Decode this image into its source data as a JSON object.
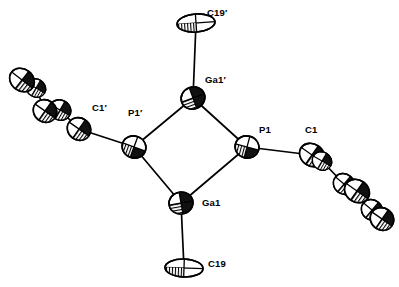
{
  "figure": {
    "type": "ortep-thermal-ellipsoid-plot",
    "background_color": "#ffffff",
    "line_color": "#000000",
    "fill_color": "#ffffff",
    "shade_color": "#1a1a1a"
  },
  "labels": [
    {
      "id": "C19p",
      "text": "C19′",
      "x": 207,
      "y": 8
    },
    {
      "id": "Ga1p",
      "text": "Ga1′",
      "x": 205,
      "y": 75
    },
    {
      "id": "P1p",
      "text": "P1′",
      "x": 128,
      "y": 108
    },
    {
      "id": "C1p",
      "text": "C1′",
      "x": 92,
      "y": 103
    },
    {
      "id": "P1",
      "text": "P1",
      "x": 259,
      "y": 125
    },
    {
      "id": "C1",
      "text": "C1",
      "x": 305,
      "y": 125
    },
    {
      "id": "Ga1",
      "text": "Ga1",
      "x": 202,
      "y": 198
    },
    {
      "id": "C19",
      "text": "C19",
      "x": 208,
      "y": 259
    }
  ],
  "ring_atoms": [
    {
      "id": "Ga1p",
      "label": "Ga1′",
      "x": 193,
      "y": 98,
      "rx": 12,
      "ry": 11,
      "rot": -20,
      "kind": "gallium"
    },
    {
      "id": "P1",
      "label": "P1",
      "x": 247,
      "y": 147,
      "rx": 12,
      "ry": 11,
      "rot": 15,
      "kind": "phosphorus"
    },
    {
      "id": "Ga1",
      "label": "Ga1",
      "x": 181,
      "y": 203,
      "rx": 12,
      "ry": 11,
      "rot": -10,
      "kind": "gallium"
    },
    {
      "id": "P1p",
      "label": "P1′",
      "x": 134,
      "y": 147,
      "rx": 12,
      "ry": 11,
      "rot": 20,
      "kind": "phosphorus"
    }
  ],
  "methyl_atoms": [
    {
      "id": "C19p",
      "label": "C19′",
      "x": 196,
      "y": 23,
      "rx": 19,
      "ry": 9,
      "rot": -4,
      "kind": "carbon-disc"
    },
    {
      "id": "C19",
      "label": "C19",
      "x": 184,
      "y": 268,
      "rx": 19,
      "ry": 9,
      "rot": 2,
      "kind": "carbon-disc"
    }
  ],
  "ring_bonds": [
    {
      "from": "Ga1p",
      "to": "P1"
    },
    {
      "from": "P1",
      "to": "Ga1"
    },
    {
      "from": "Ga1",
      "to": "P1p"
    },
    {
      "from": "P1p",
      "to": "Ga1p"
    }
  ],
  "terminal_bonds": [
    {
      "from": "Ga1p",
      "to": "C19p"
    },
    {
      "from": "Ga1",
      "to": "C19"
    },
    {
      "from": "P1",
      "to": "C1"
    },
    {
      "from": "P1p",
      "to": "C1p"
    }
  ],
  "right_substituent": {
    "name": "aryl-group-right",
    "atoms": [
      {
        "id": "C1",
        "x": 312,
        "y": 155,
        "rx": 13,
        "ry": 11,
        "rot": 35
      },
      {
        "id": "C2",
        "x": 322,
        "y": 161,
        "rx": 10,
        "ry": 9,
        "rot": 30
      },
      {
        "id": "C3",
        "x": 344,
        "y": 184,
        "rx": 11,
        "ry": 10,
        "rot": 40
      },
      {
        "id": "C4",
        "x": 357,
        "y": 191,
        "rx": 13,
        "ry": 11,
        "rot": 35
      },
      {
        "id": "C5",
        "x": 372,
        "y": 210,
        "rx": 11,
        "ry": 10,
        "rot": 40
      },
      {
        "id": "C6",
        "x": 382,
        "y": 219,
        "rx": 12,
        "ry": 11,
        "rot": 35
      }
    ],
    "bonds": [
      [
        "C1",
        "C2"
      ],
      [
        "C2",
        "C3"
      ],
      [
        "C3",
        "C4"
      ],
      [
        "C4",
        "C5"
      ],
      [
        "C5",
        "C6"
      ]
    ]
  },
  "left_substituent": {
    "name": "aryl-group-left",
    "atoms": [
      {
        "id": "C1p",
        "x": 79,
        "y": 129,
        "rx": 12,
        "ry": 11,
        "rot": 35
      },
      {
        "id": "C2p",
        "x": 60,
        "y": 110,
        "rx": 11,
        "ry": 10,
        "rot": 30
      },
      {
        "id": "C3p",
        "x": 45,
        "y": 111,
        "rx": 12,
        "ry": 11,
        "rot": 35
      },
      {
        "id": "C4p",
        "x": 36,
        "y": 88,
        "rx": 10,
        "ry": 9,
        "rot": 30
      },
      {
        "id": "C5p",
        "x": 22,
        "y": 80,
        "rx": 13,
        "ry": 11,
        "rot": 38
      }
    ],
    "bonds": [
      [
        "C1p",
        "C2p"
      ],
      [
        "C2p",
        "C3p"
      ],
      [
        "C3p",
        "C4p"
      ],
      [
        "C4p",
        "C5p"
      ]
    ]
  }
}
